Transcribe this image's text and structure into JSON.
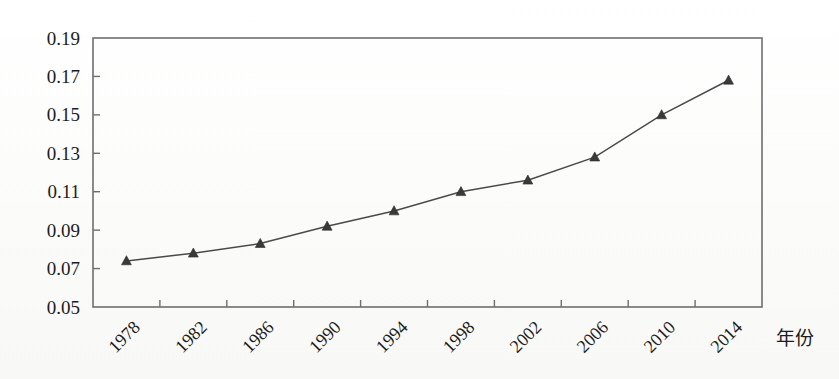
{
  "chart_data": {
    "type": "line",
    "title": "",
    "subtitle": "",
    "xlabel": "年份",
    "ylabel": "",
    "categories": [
      "1978",
      "1982",
      "1986",
      "1990",
      "1994",
      "1998",
      "2002",
      "2006",
      "2010",
      "2014"
    ],
    "x": [
      1978,
      1982,
      1986,
      1990,
      1994,
      1998,
      2002,
      2006,
      2010,
      2014
    ],
    "values": [
      0.074,
      0.078,
      0.083,
      0.092,
      0.1,
      0.11,
      0.116,
      0.128,
      0.15,
      0.168
    ],
    "series": [
      {
        "name": "",
        "values": [
          0.074,
          0.078,
          0.083,
          0.092,
          0.1,
          0.11,
          0.116,
          0.128,
          0.15,
          0.168
        ]
      }
    ],
    "ylim": [
      0.05,
      0.19
    ],
    "ytick_labels": [
      "0.05",
      "0.07",
      "0.09",
      "0.11",
      "0.13",
      "0.15",
      "0.17",
      "0.19"
    ],
    "ytick_values": [
      0.05,
      0.07,
      0.09,
      0.11,
      0.13,
      0.15,
      0.17,
      0.19
    ],
    "xtick_labels": [
      "1978",
      "1982",
      "1986",
      "1990",
      "1994",
      "1998",
      "2002",
      "2006",
      "2010",
      "2014"
    ],
    "xtick_rotation": -45,
    "grid": false,
    "legend": false,
    "legend_position": "none",
    "marker": "triangle",
    "annotations": []
  },
  "axes": {
    "x_axis_title": "年份",
    "y_axis_title": ""
  },
  "colors": {
    "line": "#4a4a4a",
    "marker": "#3a3a3a",
    "frame": "#6f6f6f",
    "text": "#1c1c1c",
    "background": "#fdfdfc"
  }
}
